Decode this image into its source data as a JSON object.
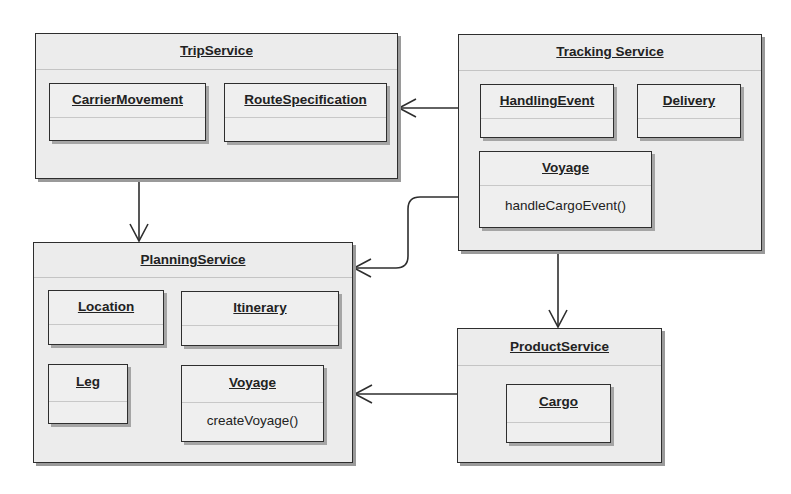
{
  "packages": {
    "trip": {
      "title": "TripService",
      "classes": [
        {
          "name": "CarrierMovement",
          "operations": ""
        },
        {
          "name": "RouteSpecification",
          "operations": ""
        }
      ]
    },
    "tracking": {
      "title": "Tracking Service",
      "classes": [
        {
          "name": "HandlingEvent",
          "operations": ""
        },
        {
          "name": "Delivery",
          "operations": ""
        },
        {
          "name": "Voyage",
          "operations": "handleCargoEvent()"
        }
      ]
    },
    "planning": {
      "title": "PlanningService",
      "classes": [
        {
          "name": "Location",
          "operations": ""
        },
        {
          "name": "Itinerary",
          "operations": ""
        },
        {
          "name": "Leg",
          "operations": ""
        },
        {
          "name": "Voyage",
          "operations": "createVoyage()"
        }
      ]
    },
    "product": {
      "title": "ProductService",
      "classes": [
        {
          "name": "Cargo",
          "operations": ""
        }
      ]
    }
  },
  "dependencies": [
    {
      "from": "Tracking Service",
      "to": "TripService"
    },
    {
      "from": "Tracking Service",
      "to": "PlanningService"
    },
    {
      "from": "TripService",
      "to": "PlanningService"
    },
    {
      "from": "Tracking Service",
      "to": "ProductService"
    },
    {
      "from": "ProductService",
      "to": "PlanningService"
    }
  ],
  "colors": {
    "line": "#2e2e2e",
    "fill": "#ececec",
    "shadow": "#9a9a9a"
  }
}
